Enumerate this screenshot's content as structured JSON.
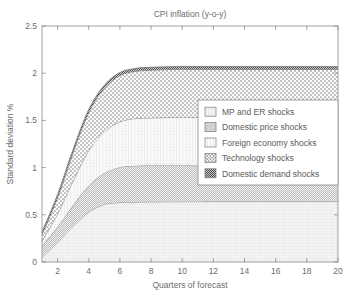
{
  "chart_data": {
    "type": "area",
    "title": "CPI inflation (y-o-y)",
    "xlabel": "Quarters of forecast",
    "ylabel": "Standard deviation %",
    "xlim": [
      1,
      20
    ],
    "ylim": [
      0,
      2.5
    ],
    "xticks": [
      2,
      4,
      6,
      8,
      10,
      12,
      14,
      16,
      18,
      20
    ],
    "xtick_labels": [
      "2",
      "4",
      "6",
      "8",
      "10",
      "12",
      "14",
      "16",
      "18",
      "20"
    ],
    "yticks": [
      0,
      0.5,
      1,
      1.5,
      2,
      2.5
    ],
    "ytick_labels": [
      "0",
      "0.5",
      "1",
      "1.5",
      "2",
      "2.5"
    ],
    "grid": false,
    "stacked": true,
    "legend_position": "center-right",
    "x": [
      1,
      2,
      3,
      4,
      5,
      6,
      7,
      8,
      9,
      10,
      11,
      12,
      13,
      14,
      15,
      16,
      17,
      18,
      19,
      20
    ],
    "series": [
      {
        "name": "MP and ER shocks",
        "pattern": "fine-grid",
        "values": [
          0.05,
          0.21,
          0.38,
          0.53,
          0.61,
          0.63,
          0.635,
          0.637,
          0.638,
          0.639,
          0.639,
          0.64,
          0.64,
          0.64,
          0.64,
          0.64,
          0.64,
          0.64,
          0.64,
          0.64
        ]
      },
      {
        "name": "Domestic price shocks",
        "pattern": "diagonal-hatch",
        "values": [
          0.12,
          0.16,
          0.22,
          0.28,
          0.33,
          0.375,
          0.385,
          0.385,
          0.384,
          0.383,
          0.382,
          0.381,
          0.38,
          0.38,
          0.38,
          0.38,
          0.38,
          0.38,
          0.38,
          0.38
        ]
      },
      {
        "name": "Foreign economy shocks",
        "pattern": "vertical-grid",
        "values": [
          0.05,
          0.14,
          0.26,
          0.37,
          0.44,
          0.48,
          0.5,
          0.505,
          0.508,
          0.51,
          0.51,
          0.51,
          0.51,
          0.51,
          0.51,
          0.51,
          0.51,
          0.51,
          0.51,
          0.51
        ]
      },
      {
        "name": "Technology shocks",
        "pattern": "dotted-cross",
        "values": [
          0.07,
          0.17,
          0.3,
          0.4,
          0.46,
          0.49,
          0.5,
          0.505,
          0.508,
          0.51,
          0.51,
          0.51,
          0.51,
          0.51,
          0.51,
          0.51,
          0.51,
          0.51,
          0.51,
          0.51
        ]
      },
      {
        "name": "Domestic demand shocks",
        "pattern": "dense-dark-check",
        "values": [
          0.03,
          0.035,
          0.035,
          0.035,
          0.033,
          0.032,
          0.031,
          0.031,
          0.03,
          0.03,
          0.03,
          0.03,
          0.03,
          0.03,
          0.03,
          0.03,
          0.03,
          0.03,
          0.03,
          0.03
        ]
      }
    ],
    "cumulative_totals": [
      0.32,
      0.715,
      1.195,
      1.615,
      1.873,
      1.977,
      2.021,
      2.043,
      2.058,
      2.062,
      2.061,
      2.061,
      2.06,
      2.06,
      2.06,
      2.06,
      2.06,
      2.06,
      2.06,
      2.06
    ],
    "annotations": []
  },
  "legend": {
    "items": [
      {
        "label": "MP and ER shocks"
      },
      {
        "label": "Domestic price shocks"
      },
      {
        "label": "Foreign economy shocks"
      },
      {
        "label": "Technology shocks"
      },
      {
        "label": "Domestic demand shocks"
      }
    ]
  }
}
